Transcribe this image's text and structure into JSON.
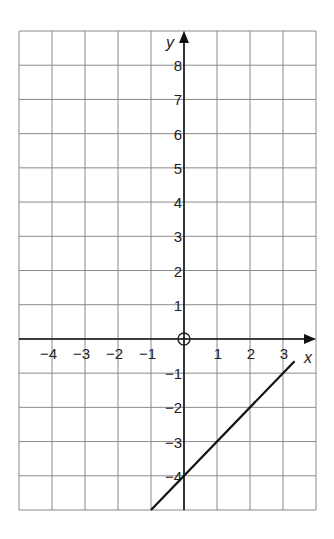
{
  "chart_data": {
    "type": "line",
    "title": "",
    "xlabel": "x",
    "ylabel": "y",
    "xlim": [
      -5,
      4
    ],
    "ylim": [
      -5,
      9
    ],
    "grid": true,
    "x_ticks": [
      -4,
      -3,
      -2,
      -1,
      1,
      2,
      3
    ],
    "y_ticks": [
      8,
      7,
      6,
      5,
      4,
      3,
      2,
      1,
      -1,
      -2,
      -3,
      -4
    ],
    "origin_label": "O",
    "x_tick_labels": [
      "−4",
      "−3",
      "−2",
      "−1",
      "1",
      "2",
      "3"
    ],
    "y_tick_labels": [
      "8",
      "7",
      "6",
      "5",
      "4",
      "3",
      "2",
      "1",
      "−1",
      "−2",
      "−3",
      "−4"
    ],
    "series": [
      {
        "name": "y = x − 4",
        "equation": "y = x - 4",
        "x": [
          -1,
          3.35
        ],
        "y": [
          -5,
          -0.65
        ],
        "color": "#111111"
      }
    ],
    "legend": null
  },
  "colors": {
    "grid": "#8a8a8a",
    "axis": "#111111",
    "line": "#111111",
    "background": "#ffffff"
  }
}
